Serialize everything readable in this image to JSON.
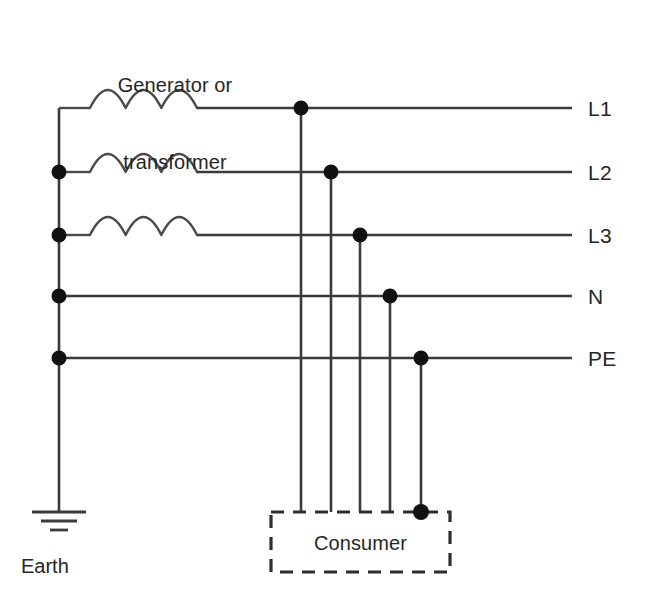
{
  "diagram": {
    "source_label": {
      "line1": "Generator or",
      "line2": "transformer"
    },
    "earth_label": "Earth",
    "consumer_label": "Consumer",
    "colors": {
      "wire": "#3b3b3b",
      "node": "#111111",
      "text": "#262626",
      "background": "#ffffff",
      "box_border": "#2e2e2e"
    },
    "rails": [
      {
        "id": "L1",
        "label": "L1",
        "y": 108,
        "has_coil": true,
        "has_source_dot": false,
        "drop_x": 301
      },
      {
        "id": "L2",
        "label": "L2",
        "y": 172,
        "has_coil": true,
        "has_source_dot": true,
        "drop_x": 331
      },
      {
        "id": "L3",
        "label": "L3",
        "y": 235,
        "has_coil": true,
        "has_source_dot": true,
        "drop_x": 360
      },
      {
        "id": "N",
        "label": "N",
        "y": 296,
        "has_coil": false,
        "has_source_dot": true,
        "drop_x": 390
      },
      {
        "id": "PE",
        "label": "PE",
        "y": 358,
        "has_coil": false,
        "has_source_dot": true,
        "drop_x": 421
      }
    ],
    "bus": {
      "x": 59,
      "y_top": 108,
      "y_bottom": 512
    },
    "coil": {
      "x_start": 90,
      "x_end": 197,
      "arcs": 3,
      "amplitude": 22
    },
    "rail_end_x": 572,
    "label_x": 588,
    "consumer_box": {
      "x": 271,
      "y": 512,
      "width": 179,
      "height": 60
    },
    "earth_symbol": {
      "x": 59,
      "y_top": 512,
      "bars": [
        {
          "y": 512,
          "half_width": 27
        },
        {
          "y": 521,
          "half_width": 18
        },
        {
          "y": 530,
          "half_width": 9
        }
      ]
    },
    "node_radius": 7.5
  }
}
